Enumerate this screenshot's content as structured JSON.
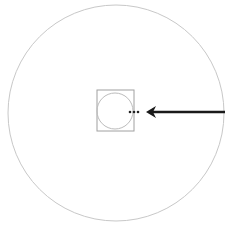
{
  "diagram": {
    "background": "#ffffff",
    "outer_circle": {
      "cx": 116,
      "cy": 113,
      "r": 108,
      "stroke": "#c8c8c8"
    },
    "center_square": {
      "x": 97,
      "y": 90,
      "width": 37,
      "height": 41,
      "stroke": "#a0a0a0"
    },
    "inner_circle": {
      "cx": 115,
      "cy": 111,
      "r": 18,
      "stroke": "#bcbcbc"
    },
    "dots": [
      {
        "cx": 130,
        "cy": 112,
        "r": 1.3
      },
      {
        "cx": 134,
        "cy": 112,
        "r": 1.3
      },
      {
        "cx": 138,
        "cy": 112,
        "r": 1.3
      }
    ],
    "arrow": {
      "x1": 225,
      "y1": 112,
      "x2": 146,
      "y2": 112,
      "stroke": "#1a1a1a",
      "width": 2.5,
      "direction": "left"
    }
  }
}
